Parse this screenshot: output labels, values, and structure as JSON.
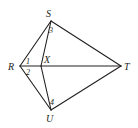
{
  "diagram": {
    "vertices": [
      {
        "id": "S",
        "label": "S",
        "x": 51,
        "y": 21,
        "lx": 50,
        "ly": 17
      },
      {
        "id": "R",
        "label": "R",
        "x": 20,
        "y": 66,
        "lx": 10,
        "ly": 70
      },
      {
        "id": "X",
        "label": "X",
        "x": 41,
        "y": 66,
        "lx": 44,
        "ly": 64
      },
      {
        "id": "T",
        "label": "T",
        "x": 121,
        "y": 66,
        "lx": 124,
        "ly": 70
      },
      {
        "id": "U",
        "label": "U",
        "x": 51,
        "y": 110,
        "lx": 48,
        "ly": 122
      }
    ],
    "segments": [
      {
        "from": "S",
        "to": "T"
      },
      {
        "from": "T",
        "to": "U"
      },
      {
        "from": "R",
        "to": "S"
      },
      {
        "from": "R",
        "to": "U"
      },
      {
        "from": "R",
        "to": "T"
      },
      {
        "from": "S",
        "to": "X"
      },
      {
        "from": "X",
        "to": "U"
      }
    ],
    "angle_labels": [
      {
        "label": "1",
        "x": 27,
        "y": 64
      },
      {
        "label": "2",
        "x": 27,
        "y": 75
      },
      {
        "label": "3",
        "x": 49,
        "y": 32
      },
      {
        "label": "4",
        "x": 50,
        "y": 104
      }
    ],
    "colors": {
      "stroke": "#231f20",
      "background": "#ffffff"
    }
  }
}
